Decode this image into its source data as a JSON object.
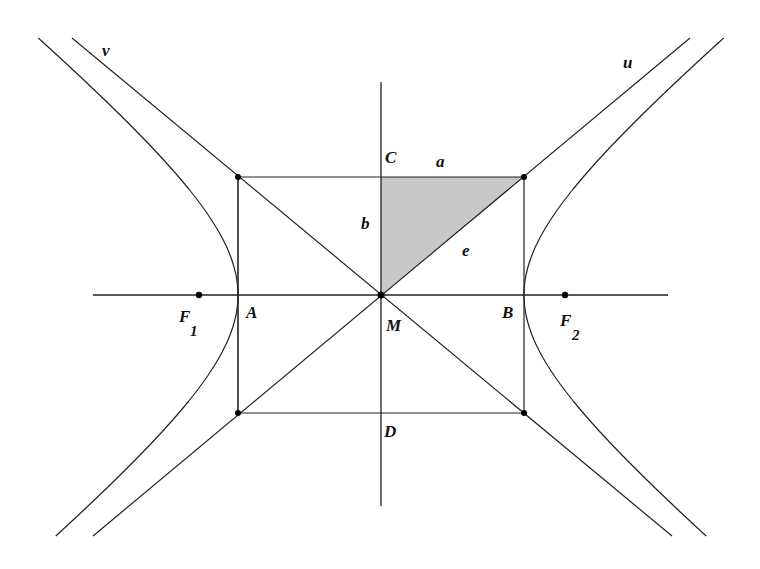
{
  "diagram": {
    "type": "hyperbola-construction",
    "colors": {
      "background": "#ffffff",
      "stroke": "#222222",
      "shade": "#c8c8c8",
      "point": "#000000"
    },
    "center": {
      "x": 381,
      "y": 295
    },
    "half_axes_px": {
      "a": 143,
      "b": 118
    },
    "labels": {
      "v": "v",
      "u": "u",
      "C": "C",
      "D": "D",
      "A": "A",
      "B": "B",
      "M": "M",
      "a": "a",
      "b": "b",
      "e": "e",
      "F1_main": "F",
      "F1_sub": "1",
      "F2_main": "F",
      "F2_sub": "2"
    },
    "points": {
      "M": [
        381,
        295
      ],
      "F1": [
        199,
        295
      ],
      "F2": [
        565,
        295
      ],
      "top_left": [
        238,
        177
      ],
      "top_right": [
        524,
        177
      ],
      "bottom_left": [
        238,
        413
      ],
      "bottom_right": [
        524,
        413
      ]
    }
  }
}
